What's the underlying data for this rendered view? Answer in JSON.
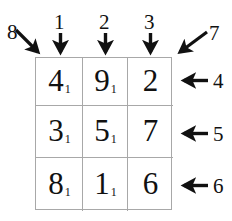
{
  "diagram": {
    "colors": {
      "ink": "#111111",
      "grid_line": "#a8a8a8",
      "background": "#ffffff"
    },
    "grid": {
      "rows": 3,
      "cols": 3,
      "cells": [
        [
          {
            "value": "4",
            "subscript": "1"
          },
          {
            "value": "9",
            "subscript": "1"
          },
          {
            "value": "2",
            "subscript": ""
          }
        ],
        [
          {
            "value": "3",
            "subscript": "1"
          },
          {
            "value": "5",
            "subscript": "1"
          },
          {
            "value": "7",
            "subscript": ""
          }
        ],
        [
          {
            "value": "8",
            "subscript": "1"
          },
          {
            "value": "1",
            "subscript": "1"
          },
          {
            "value": "6",
            "subscript": ""
          }
        ]
      ]
    },
    "labels": {
      "top": [
        {
          "text": "1",
          "arrow": "arrow-down-icon"
        },
        {
          "text": "2",
          "arrow": "arrow-down-icon"
        },
        {
          "text": "3",
          "arrow": "arrow-down-icon"
        }
      ],
      "right": [
        {
          "text": "4",
          "arrow": "arrow-left-icon"
        },
        {
          "text": "5",
          "arrow": "arrow-left-icon"
        },
        {
          "text": "6",
          "arrow": "arrow-left-icon"
        }
      ],
      "corners": [
        {
          "text": "7",
          "arrow": "arrow-diagonal-down-left-icon"
        },
        {
          "text": "8",
          "arrow": "arrow-diagonal-down-right-icon"
        }
      ]
    }
  }
}
